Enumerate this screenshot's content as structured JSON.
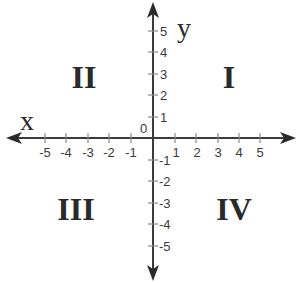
{
  "diagram": {
    "type": "cartesian-coordinate-plane",
    "axes": {
      "x_label": "x",
      "y_label": "y",
      "origin_label": "0",
      "x_ticks": [
        "-5",
        "-4",
        "-3",
        "-2",
        "-1",
        "1",
        "2",
        "3",
        "4",
        "5"
      ],
      "y_ticks_positive": [
        "1",
        "2",
        "3",
        "4",
        "5"
      ],
      "y_ticks_negative": [
        "-1",
        "-2",
        "-3",
        "-4",
        "-5"
      ]
    },
    "quadrants": {
      "q1": "I",
      "q2": "II",
      "q3": "III",
      "q4": "IV"
    },
    "colors": {
      "axis": "#3a3a3a",
      "text": "#2a2a2a",
      "background": "#ffffff"
    }
  }
}
